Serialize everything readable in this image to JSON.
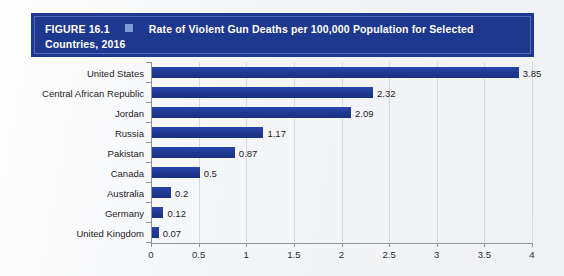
{
  "banner": {
    "figure_label": "FIGURE 16.1",
    "square_icon": "square-bullet-icon",
    "title": "Rate of Violent Gun Deaths per 100,000 Population for Selected Countries, 2016",
    "title_line1": "Rate of Violent Gun Deaths per 100,000 Population for Selected",
    "title_line2": "Countries, 2016",
    "background_color": "#1e378f",
    "text_color": "#ffffff",
    "square_color": "#7e9ad6"
  },
  "chart_data": {
    "type": "bar",
    "orientation": "horizontal",
    "title": "Rate of Violent Gun Deaths per 100,000 Population for Selected Countries, 2016",
    "xlabel": "",
    "ylabel": "",
    "xlim": [
      0,
      4
    ],
    "grid": true,
    "grid_axis": "x",
    "legend": false,
    "bar_color": "#20389c",
    "xticks": [
      0,
      0.5,
      1,
      1.5,
      2,
      2.5,
      3,
      3.5,
      4
    ],
    "xtick_labels": [
      "0",
      "0.5",
      "1",
      "1.5",
      "2",
      "2.5",
      "3",
      "3.5",
      "4"
    ],
    "categories": [
      "United States",
      "Central African Republic",
      "Jordan",
      "Russia",
      "Pakistan",
      "Canada",
      "Australia",
      "Germany",
      "United Kingdom"
    ],
    "values": [
      3.85,
      2.32,
      2.09,
      1.17,
      0.87,
      0.5,
      0.2,
      0.12,
      0.07
    ],
    "value_labels": [
      "3.85",
      "2.32",
      "2.09",
      "1.17",
      "0.87",
      "0.5",
      "0.2",
      "0.12",
      "0.07"
    ]
  }
}
